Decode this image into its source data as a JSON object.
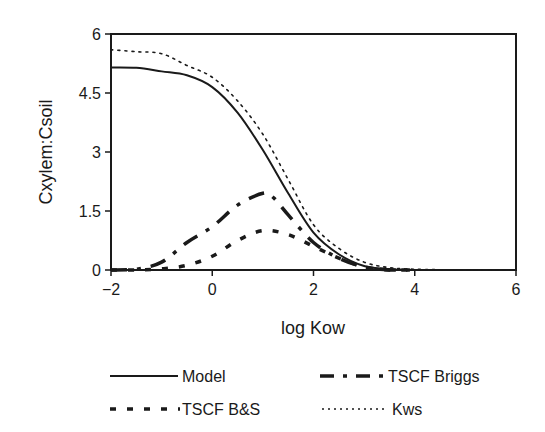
{
  "chart_data": {
    "type": "line",
    "title": "",
    "xlabel": "log Kow",
    "ylabel": "Cxylem:Csoil",
    "xlim": [
      -2,
      6
    ],
    "ylim": [
      0,
      6
    ],
    "xticks": [
      -2,
      0,
      2,
      4,
      6
    ],
    "xtick_labels": [
      "−2",
      "0",
      "2",
      "4",
      "6"
    ],
    "yticks": [
      0,
      1.5,
      3,
      4.5,
      6
    ],
    "ytick_labels": [
      "0",
      "1.5",
      "3",
      "4.5",
      "6"
    ],
    "grid": false,
    "legend_position": "below",
    "series": [
      {
        "name": "Model",
        "style": "solid",
        "x": [
          -2,
          -1.5,
          -1,
          -0.5,
          0,
          0.5,
          1,
          1.5,
          2,
          2.5,
          3,
          3.5,
          4,
          5,
          6
        ],
        "y": [
          5.15,
          5.14,
          5.05,
          4.95,
          4.65,
          4.0,
          3.05,
          1.95,
          0.95,
          0.4,
          0.1,
          0.02,
          0.0,
          0.0,
          0.0
        ]
      },
      {
        "name": "TSCF Briggs",
        "style": "dash-dot",
        "x": [
          -2,
          -1.5,
          -1,
          -0.5,
          0,
          0.5,
          1,
          1.2,
          1.5,
          2,
          2.5,
          3,
          3.5,
          4
        ],
        "y": [
          0.0,
          0.02,
          0.2,
          0.7,
          1.1,
          1.65,
          1.95,
          1.85,
          1.4,
          0.7,
          0.3,
          0.08,
          0.0,
          0.0
        ]
      },
      {
        "name": "TSCF B&S",
        "style": "dashed",
        "x": [
          -2,
          -1.5,
          -1,
          -0.5,
          0,
          0.5,
          1,
          1.5,
          2,
          2.5,
          3,
          3.5,
          4
        ],
        "y": [
          0.0,
          0.0,
          0.03,
          0.12,
          0.35,
          0.75,
          1.0,
          0.9,
          0.6,
          0.3,
          0.08,
          0.0,
          0.0
        ]
      },
      {
        "name": "Kws",
        "style": "dotted",
        "x": [
          -2,
          -1.5,
          -1,
          -0.5,
          0,
          0.5,
          1,
          1.5,
          2,
          2.5,
          3,
          3.5,
          4,
          5,
          6
        ],
        "y": [
          5.6,
          5.55,
          5.5,
          5.2,
          4.9,
          4.3,
          3.45,
          2.3,
          1.15,
          0.55,
          0.2,
          0.06,
          0.02,
          0.0,
          0.0
        ]
      }
    ]
  },
  "legend": {
    "items": [
      {
        "label": "Model"
      },
      {
        "label": "TSCF Briggs"
      },
      {
        "label": "TSCF B&S"
      },
      {
        "label": "Kws"
      }
    ]
  }
}
